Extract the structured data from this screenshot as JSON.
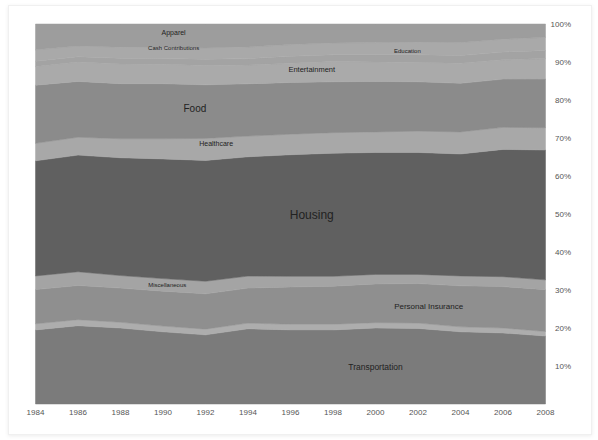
{
  "chart_data": {
    "type": "area",
    "stacked": true,
    "normalized": true,
    "title": "",
    "xlabel": "",
    "ylabel": "",
    "x": [
      1984,
      1986,
      1988,
      1990,
      1992,
      1994,
      1996,
      1998,
      2000,
      2002,
      2004,
      2006,
      2008
    ],
    "x_ticks": [
      "1984",
      "1986",
      "1988",
      "1990",
      "1992",
      "1994",
      "1996",
      "1998",
      "2000",
      "2002",
      "2004",
      "2006",
      "2008"
    ],
    "y_ticks": [
      "10%",
      "20%",
      "30%",
      "40%",
      "50%",
      "60%",
      "70%",
      "80%",
      "90%",
      "100%"
    ],
    "ylim": [
      0,
      100
    ],
    "grid": false,
    "legend": "none (inline labels)",
    "series": [
      {
        "name": "Transportation",
        "color": "#7b7b7b",
        "values": [
          19.5,
          20.6,
          20.0,
          19.0,
          18.2,
          20.0,
          19.5,
          19.5,
          20.0,
          19.9,
          19.0,
          18.7,
          17.9
        ]
      },
      {
        "name": "Other",
        "color": "#adadad",
        "values": [
          1.6,
          1.6,
          1.5,
          1.5,
          1.5,
          1.5,
          1.5,
          1.5,
          1.4,
          1.4,
          1.3,
          1.3,
          1.2
        ]
      },
      {
        "name": "Personal Insurance",
        "color": "#8f8f8f",
        "values": [
          9.0,
          9.0,
          9.0,
          9.2,
          9.3,
          9.3,
          9.8,
          10.0,
          10.2,
          10.4,
          10.8,
          10.9,
          11.0
        ]
      },
      {
        "name": "Miscellaneous",
        "color": "#a4a4a4",
        "values": [
          3.6,
          3.6,
          3.3,
          3.3,
          3.3,
          3.2,
          2.8,
          2.6,
          2.5,
          2.4,
          2.6,
          2.6,
          2.6
        ]
      },
      {
        "name": "Housing",
        "color": "#606060",
        "values": [
          30.3,
          30.7,
          31.0,
          31.5,
          31.8,
          31.7,
          32.0,
          32.4,
          32.1,
          32.1,
          32.1,
          33.5,
          34.2
        ]
      },
      {
        "name": "Healthcare",
        "color": "#a8a8a8",
        "values": [
          4.6,
          4.7,
          5.0,
          5.3,
          5.8,
          5.5,
          5.4,
          5.4,
          5.4,
          5.6,
          5.8,
          5.8,
          5.9
        ]
      },
      {
        "name": "Food",
        "color": "#8b8b8b",
        "values": [
          15.3,
          14.7,
          14.5,
          14.5,
          14.1,
          13.9,
          13.6,
          13.4,
          13.3,
          13.0,
          12.8,
          12.7,
          12.8
        ]
      },
      {
        "name": "Entertainment",
        "color": "#aaaaaa",
        "values": [
          4.9,
          5.1,
          5.2,
          5.1,
          5.1,
          5.0,
          5.1,
          5.3,
          5.1,
          5.1,
          5.3,
          5.1,
          5.4
        ]
      },
      {
        "name": "Education",
        "color": "#a3a3a3",
        "values": [
          1.4,
          1.4,
          1.5,
          1.5,
          1.6,
          1.7,
          1.8,
          1.8,
          1.9,
          2.0,
          2.0,
          2.0,
          2.1
        ]
      },
      {
        "name": "Cash Contributions",
        "color": "#a9a9a9",
        "values": [
          3.0,
          2.8,
          2.9,
          2.9,
          3.0,
          3.1,
          3.1,
          3.1,
          3.2,
          3.3,
          3.4,
          3.4,
          3.5
        ]
      },
      {
        "name": "Apparel",
        "color": "#9d9d9d",
        "values": [
          6.8,
          5.8,
          6.1,
          6.2,
          6.3,
          6.1,
          5.4,
          5.0,
          4.9,
          4.8,
          4.9,
          4.0,
          3.5
        ]
      }
    ],
    "annotations": [
      {
        "text": "Apparel",
        "x": 1990.5,
        "y": 97.5,
        "size": 7
      },
      {
        "text": "Cash Contributions",
        "x": 1990.5,
        "y": 93.5,
        "size": 6
      },
      {
        "text": "Education",
        "x": 2001.5,
        "y": 92.8,
        "size": 6
      },
      {
        "text": "Entertainment",
        "x": 1997,
        "y": 88,
        "size": 7.5
      },
      {
        "text": "Food",
        "x": 1991.5,
        "y": 77.5,
        "size": 10
      },
      {
        "text": "Healthcare",
        "x": 1992.5,
        "y": 68.5,
        "size": 7
      },
      {
        "text": "Housing",
        "x": 1997,
        "y": 49.5,
        "size": 12
      },
      {
        "text": "Miscellaneous",
        "x": 1990.2,
        "y": 31.2,
        "size": 6
      },
      {
        "text": "Personal Insurance",
        "x": 2002.5,
        "y": 25.5,
        "size": 8
      },
      {
        "text": "Transportation",
        "x": 2000,
        "y": 9.6,
        "size": 8.5
      }
    ]
  },
  "layout": {
    "plot": {
      "left": 35.5,
      "right": 545.5,
      "top": 24,
      "bottom": 404
    }
  }
}
